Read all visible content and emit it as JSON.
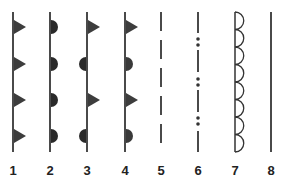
{
  "colors": {
    "line": "#4a4a4a",
    "fill": "#333333",
    "label": "#222222"
  },
  "symbols": [
    {
      "number": "1",
      "x": 13,
      "style": "triangles-right"
    },
    {
      "number": "2",
      "x": 50,
      "style": "semicircles-right"
    },
    {
      "number": "3",
      "x": 87,
      "style": "alternating-triangle-right-semicircle-left"
    },
    {
      "number": "4",
      "x": 125,
      "style": "alternating-triangle-semicircle-right"
    },
    {
      "number": "5",
      "x": 161,
      "style": "dashed"
    },
    {
      "number": "6",
      "x": 198,
      "style": "dash-double-dot"
    },
    {
      "number": "7",
      "x": 235,
      "style": "scalloped"
    },
    {
      "number": "8",
      "x": 271,
      "style": "solid"
    }
  ]
}
